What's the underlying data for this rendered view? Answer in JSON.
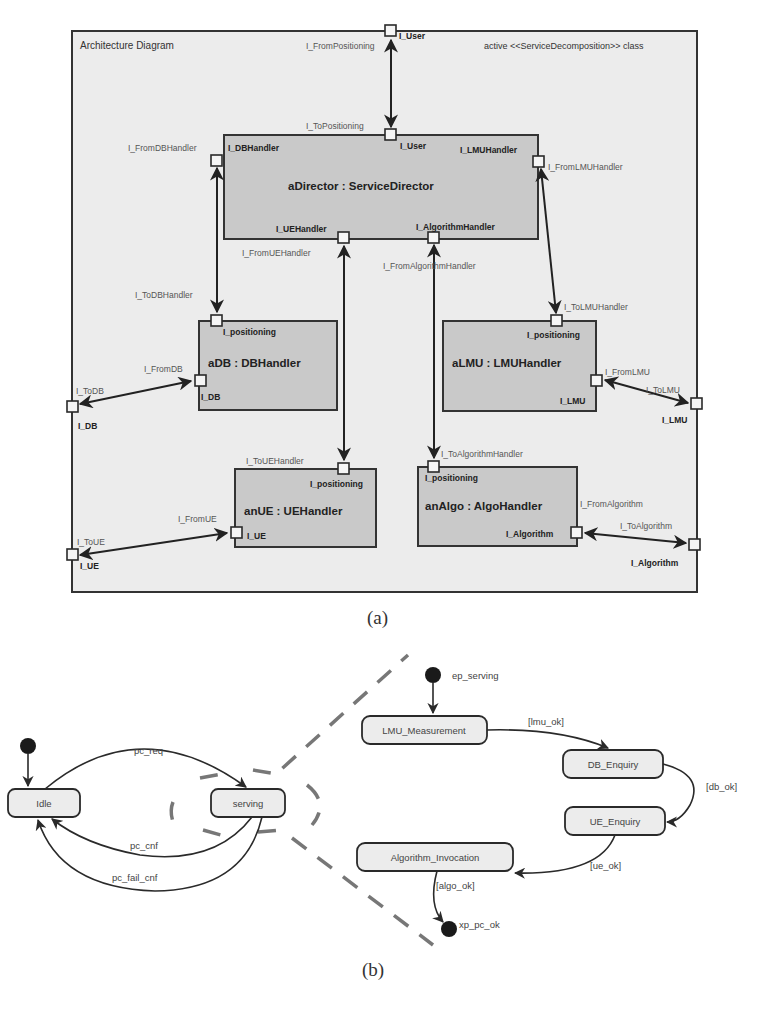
{
  "figure_a": {
    "caption": "(a)",
    "frame": {
      "title": "Architecture Diagram",
      "stereotype": "active <<ServiceDecomposition>> class"
    },
    "blocks": {
      "director": {
        "name": "aDirector : ServiceDirector",
        "ports": {
          "user": "I_User",
          "db_handler": "I_DBHandler",
          "lmu_handler": "I_LMUHandler",
          "ue_handler": "I_UEHandler",
          "algorithm_handler": "I_AlgorithmHandler"
        }
      },
      "db": {
        "name": "aDB : DBHandler",
        "ports": {
          "positioning": "I_positioning",
          "db": "I_DB"
        }
      },
      "lmu": {
        "name": "aLMU : LMUHandler",
        "ports": {
          "positioning": "I_positioning",
          "lmu": "I_LMU"
        }
      },
      "ue": {
        "name": "anUE : UEHandler",
        "ports": {
          "positioning": "I_positioning",
          "ue": "I_UE"
        }
      },
      "algo": {
        "name": "anAlgo : AlgoHandler",
        "ports": {
          "positioning": "I_positioning",
          "algorithm": "I_Algorithm"
        }
      }
    },
    "frame_ports": {
      "user": "I_User",
      "db": "I_DB",
      "ue": "I_UE",
      "lmu": "I_LMU",
      "algorithm": "I_Algorithm"
    },
    "connector_labels": {
      "from_positioning": "I_FromPositioning",
      "to_positioning": "I_ToPositioning",
      "from_db_handler": "I_FromDBHandler",
      "to_db_handler": "I_ToDBHandler",
      "from_lmu_handler": "I_FromLMUHandler",
      "to_lmu_handler": "I_ToLMUHandler",
      "from_ue_handler": "I_FromUEHandler",
      "to_ue_handler": "I_ToUEHandler",
      "from_algorithm_handler": "I_FromAlgorithmHandler",
      "to_algorithm_handler": "I_ToAlgorithmHandler",
      "from_db": "I_FromDB",
      "to_db": "I_ToDB",
      "from_lmu": "I_FromLMU",
      "to_lmu": "I_ToLMU",
      "from_ue": "I_FromUE",
      "to_ue": "I_ToUE",
      "from_algorithm": "I_FromAlgorithm",
      "to_algorithm": "I_ToAlgorithm"
    }
  },
  "figure_b": {
    "caption": "(b)",
    "top_level": {
      "states": [
        "Idle",
        "serving"
      ],
      "transitions": [
        {
          "from": "initial",
          "to": "Idle",
          "label": ""
        },
        {
          "from": "Idle",
          "to": "serving",
          "label": "pc_req"
        },
        {
          "from": "serving",
          "to": "Idle",
          "label": "pc_cnf"
        },
        {
          "from": "serving",
          "to": "Idle",
          "label": "pc_fail_cnf"
        }
      ]
    },
    "serving_detail": {
      "entry_point": "ep_serving",
      "exit_point": "xp_pc_ok",
      "states": [
        "LMU_Measurement",
        "DB_Enquiry",
        "UE_Enquiry",
        "Algorithm_Invocation"
      ],
      "transitions": [
        {
          "from": "ep_serving",
          "to": "LMU_Measurement",
          "label": ""
        },
        {
          "from": "LMU_Measurement",
          "to": "DB_Enquiry",
          "label": "[lmu_ok]"
        },
        {
          "from": "DB_Enquiry",
          "to": "UE_Enquiry",
          "label": "[db_ok]"
        },
        {
          "from": "UE_Enquiry",
          "to": "Algorithm_Invocation",
          "label": "[ue_ok]"
        },
        {
          "from": "Algorithm_Invocation",
          "to": "xp_pc_ok",
          "label": "[algo_ok]"
        }
      ]
    }
  }
}
